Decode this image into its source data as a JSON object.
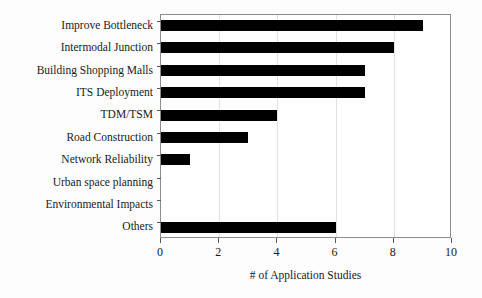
{
  "chart_data": {
    "type": "bar",
    "orientation": "horizontal",
    "title": "",
    "xlabel": "# of Application Studies",
    "ylabel": "",
    "categories": [
      "Improve Bottleneck",
      "Intermodal Junction",
      "Building Shopping Malls",
      "ITS Deployment",
      "TDM/TSM",
      "Road Construction",
      "Network Reliability",
      "Urban space planning",
      "Environmental Impacts",
      "Others"
    ],
    "values": [
      9,
      8,
      7,
      7,
      4,
      3,
      1,
      0,
      0,
      6
    ],
    "xlim": [
      0,
      10
    ],
    "xticks": [
      0,
      2,
      4,
      6,
      8,
      10
    ],
    "xtick_labels": [
      "0",
      "2",
      "4",
      "6",
      "8",
      "10"
    ],
    "grid": true,
    "legend": false,
    "bar_color": "#000000",
    "axis_color": "#8c8c8c",
    "background_color": "#ffffff"
  }
}
